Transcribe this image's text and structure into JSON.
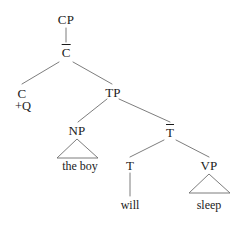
{
  "figure": {
    "kind": "syntax-tree",
    "notation": "x-bar",
    "background_color": "#ffffff",
    "line_color": "#6e6e6e",
    "text_color": "#1b1b1b"
  },
  "nodes": {
    "cp": "CP",
    "c_bar": "C",
    "c_head": "C",
    "c_feature": "+Q",
    "tp": "TP",
    "np": "NP",
    "t_bar": "T",
    "t_head": "T",
    "vp": "VP"
  },
  "terminals": {
    "np_phrase": "the boy",
    "t_word": "will",
    "vp_word": "sleep"
  },
  "tree_data": {
    "root": "CP",
    "sentence": "the boy will sleep",
    "edges": [
      {
        "from": "CP",
        "to": "C-bar",
        "style": "line"
      },
      {
        "from": "C-bar",
        "to": "C",
        "style": "line"
      },
      {
        "from": "C-bar",
        "to": "TP",
        "style": "line"
      },
      {
        "from": "TP",
        "to": "NP",
        "style": "line"
      },
      {
        "from": "TP",
        "to": "T-bar",
        "style": "line"
      },
      {
        "from": "NP",
        "to": "the boy",
        "style": "triangle"
      },
      {
        "from": "T-bar",
        "to": "T",
        "style": "line"
      },
      {
        "from": "T-bar",
        "to": "VP",
        "style": "line"
      },
      {
        "from": "T",
        "to": "will",
        "style": "line"
      },
      {
        "from": "VP",
        "to": "sleep",
        "style": "triangle"
      }
    ]
  }
}
